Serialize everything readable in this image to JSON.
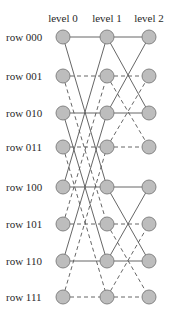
{
  "levels": [
    {
      "label": "level 0",
      "x": 63
    },
    {
      "label": "level 1",
      "x": 107
    },
    {
      "label": "level 2",
      "x": 149
    }
  ],
  "rows": [
    {
      "label": "row 000",
      "y": 37
    },
    {
      "label": "row 001",
      "y": 76
    },
    {
      "label": "row 010",
      "y": 113
    },
    {
      "label": "row 011",
      "y": 147
    },
    {
      "label": "row 100",
      "y": 187
    },
    {
      "label": "row 101",
      "y": 224
    },
    {
      "label": "row 110",
      "y": 261
    },
    {
      "label": "row 111",
      "y": 297
    }
  ],
  "edges_level0_to_1": {
    "straight": true,
    "cross_xor": 4
  },
  "edges_level1_to_2": {
    "straight": true,
    "cross_xor": 2
  },
  "style": {
    "node_fill": "#bdbdbd",
    "node_stroke": "#7a7a7a",
    "edge_color": "#555555",
    "solid_rows": "even",
    "dashed_rows": "odd"
  }
}
